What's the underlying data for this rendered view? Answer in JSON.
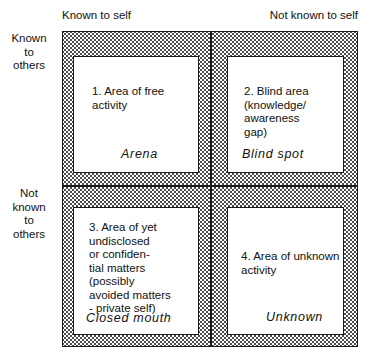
{
  "diagram": {
    "column_headers": [
      {
        "id": "known-to-self",
        "label": "Known to self"
      },
      {
        "id": "not-known-to-self",
        "label": "Not known to self"
      }
    ],
    "row_headers": [
      {
        "id": "known-to-others",
        "label": "Known\nto\nothers"
      },
      {
        "id": "not-known-to-others",
        "label": "Not\nknown\nto\nothers"
      }
    ],
    "quadrants": [
      {
        "number": "1",
        "body": "1. Area of free\n    activity",
        "term": "Arena"
      },
      {
        "number": "2",
        "body": "2. Blind area\n    (knowledge/\n    awareness\n    gap)",
        "term": "Blind spot"
      },
      {
        "number": "3",
        "body": "3. Area of yet\n    undisclosed\n    or confiden-\n    tial matters\n    (possibly\n    avoided matters\n    - private self)",
        "term": "Closed mouth"
      },
      {
        "number": "4",
        "body": "4. Area of unknown\n    activity",
        "term": "Unknown"
      }
    ],
    "colors": {
      "line": "#1a1a1a",
      "stipple": "#4a4a4a",
      "background": "#ffffff",
      "text": "#111111"
    }
  }
}
